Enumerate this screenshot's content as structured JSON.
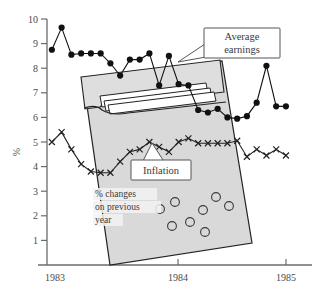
{
  "chart_data": {
    "type": "line",
    "title": "",
    "xlabel": "",
    "ylabel": "%",
    "ylim": [
      0,
      10
    ],
    "xlim": [
      1983.0,
      1985.1
    ],
    "yticks": [
      "1",
      "2",
      "3",
      "4",
      "5",
      "6",
      "7",
      "8",
      "9",
      "10"
    ],
    "xticks": [
      "1983",
      "1984",
      "1985"
    ],
    "grid": false,
    "legend_position": "callout-annotations",
    "annotations": [
      {
        "name": "average-earnings",
        "text_line1": "Average",
        "text_line2": "earnings"
      },
      {
        "name": "inflation",
        "text": "Inflation"
      },
      {
        "name": "percent-changes",
        "line1": "% changes",
        "line2": "on previous",
        "line3": "year"
      }
    ],
    "series": [
      {
        "name": "Average earnings",
        "marker": "filled-circle",
        "color": "#111111",
        "x": [
          1983.04,
          1983.12,
          1983.2,
          1983.28,
          1983.36,
          1983.44,
          1983.52,
          1983.6,
          1983.68,
          1983.76,
          1983.84,
          1983.92,
          1984.0,
          1984.08,
          1984.16,
          1984.24,
          1984.32,
          1984.4,
          1984.48,
          1984.56,
          1984.64,
          1984.72,
          1984.8,
          1984.88,
          1984.96
        ],
        "values": [
          8.75,
          9.65,
          8.55,
          8.6,
          8.6,
          8.6,
          8.2,
          7.7,
          8.35,
          8.35,
          8.6,
          7.3,
          8.5,
          7.35,
          7.3,
          6.3,
          6.2,
          6.35,
          6.0,
          5.95,
          6.05,
          6.6,
          8.1,
          6.45,
          6.45
        ]
      },
      {
        "name": "Inflation",
        "marker": "cross",
        "color": "#222222",
        "x": [
          1983.04,
          1983.12,
          1983.2,
          1983.28,
          1983.36,
          1983.44,
          1983.52,
          1983.6,
          1983.68,
          1983.76,
          1983.84,
          1983.92,
          1984.0,
          1984.08,
          1984.16,
          1984.24,
          1984.32,
          1984.4,
          1984.48,
          1984.56,
          1984.64,
          1984.72,
          1984.8,
          1984.88,
          1984.96
        ],
        "values": [
          5.0,
          5.4,
          4.7,
          4.1,
          3.8,
          3.75,
          3.75,
          4.2,
          4.6,
          4.7,
          5.0,
          4.8,
          4.6,
          5.0,
          5.15,
          4.95,
          4.95,
          4.95,
          4.95,
          5.05,
          4.4,
          4.7,
          4.45,
          4.7,
          4.45
        ]
      }
    ]
  },
  "axis": {
    "y_label": "%",
    "y_ticks": [
      {
        "label": "10",
        "value": 10
      },
      {
        "label": "9",
        "value": 9
      },
      {
        "label": "8",
        "value": 8
      },
      {
        "label": "7",
        "value": 7
      },
      {
        "label": "6",
        "value": 6
      },
      {
        "label": "5",
        "value": 5
      },
      {
        "label": "4",
        "value": 4
      },
      {
        "label": "3",
        "value": 3
      },
      {
        "label": "2",
        "value": 2
      },
      {
        "label": "1",
        "value": 1
      }
    ],
    "x_ticks": [
      {
        "label": "1983"
      },
      {
        "label": "1984"
      },
      {
        "label": "1985"
      }
    ]
  },
  "callouts": {
    "earnings_line1": "Average",
    "earnings_line2": "earnings",
    "inflation": "Inflation"
  },
  "bag": {
    "caption_line1": "% changes",
    "caption_line2": "on previous",
    "caption_line3": "year",
    "coin_count": 8,
    "fill_color": "#d9d9d9",
    "stroke_color": "#222222"
  },
  "colors": {
    "axis": "#6b6b6b",
    "earnings": "#111111",
    "inflation": "#222222",
    "bag_fill": "#d9d9d9",
    "text": "#3a3a3a",
    "callout_bg": "#ffffff"
  }
}
